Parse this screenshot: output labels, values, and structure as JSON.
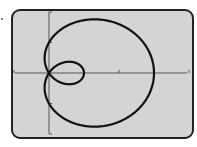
{
  "chart_data": {
    "type": "line",
    "subtype": "polar",
    "title": "",
    "equation": "r = 1 + 2cos(theta)",
    "curve_name": "limacon with inner loop",
    "xlabel": "",
    "ylabel": "",
    "xlim": [
      -1,
      4
    ],
    "ylim": [
      -2,
      2
    ],
    "x_ticks": [
      -1,
      2,
      4
    ],
    "y_ticks": [
      -2,
      -1,
      1,
      2
    ],
    "grid": false,
    "legend": null,
    "key_points": {
      "outer_loop_rightmost": [
        3,
        0
      ],
      "inner_loop_rightmost": [
        1,
        0
      ],
      "pole": [
        0,
        0
      ],
      "max_y": 1.76,
      "min_y": -1.76
    },
    "colors": {
      "screen_bg": "#d4d4d4",
      "curve": "#111111",
      "axes": "#555555",
      "frame": "#222222"
    }
  }
}
